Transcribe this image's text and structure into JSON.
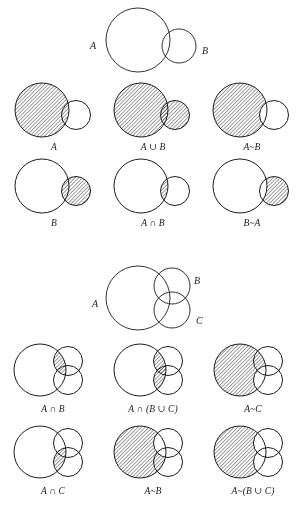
{
  "figure": {
    "background_color": "#ffffff",
    "stroke_color": "#1b1b1b",
    "hatch_color": "#2a2a2a",
    "hatch_style": "diagonal-lines-45deg"
  },
  "two_set_key": {
    "label_a": "A",
    "label_b": "B"
  },
  "three_set_key": {
    "label_a": "A",
    "label_b": "B",
    "label_c": "C"
  },
  "two_set_panels": [
    {
      "caption": "A",
      "shade": "A",
      "name": "panel-a"
    },
    {
      "caption": "A ∪ B",
      "shade": "AuB",
      "name": "panel-a-union-b"
    },
    {
      "caption": "A~B",
      "shade": "AmB",
      "name": "panel-a-minus-b"
    },
    {
      "caption": "B",
      "shade": "B",
      "name": "panel-b"
    },
    {
      "caption": "A ∩ B",
      "shade": "AnB",
      "name": "panel-a-intersect-b"
    },
    {
      "caption": "B~A",
      "shade": "BmA",
      "name": "panel-b-minus-a"
    }
  ],
  "three_set_panels": [
    {
      "caption": "A ∩ B",
      "shade": "AnB",
      "name": "panel3-a-intersect-b"
    },
    {
      "caption": "A ∩ (B ∪ C)",
      "shade": "An_BuC",
      "name": "panel3-a-intersect-b-union-c"
    },
    {
      "caption": "A~C",
      "shade": "AmC",
      "name": "panel3-a-minus-c"
    },
    {
      "caption": "A ∩ C",
      "shade": "AnC",
      "name": "panel3-a-intersect-c"
    },
    {
      "caption": "A~B",
      "shade": "AmB",
      "name": "panel3-a-minus-b"
    },
    {
      "caption": "A~(B ∪ C)",
      "shade": "Am_BuC",
      "name": "panel3-a-minus-b-union-c"
    }
  ],
  "captions": {
    "A": "A",
    "B": "B",
    "C": "C",
    "A_union_B": "A ∪ B",
    "A_intersect_B": "A ∩ B",
    "A_minus_B": "A~B",
    "B_minus_A": "B~A",
    "A_intersect_BuC": "A ∩ (B ∪ C)",
    "A_minus_C": "A~C",
    "A_intersect_C": "A ∩ C",
    "A_minus_BuC": "A~(B ∪ C)"
  }
}
